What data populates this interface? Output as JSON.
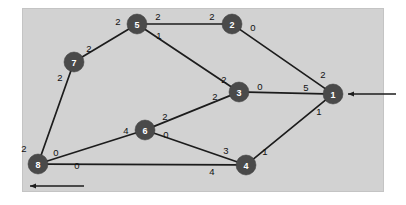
{
  "figure": {
    "background_color": "#ffffff",
    "panel_color": "#d2d2d2",
    "node_color": "#4a4a4a",
    "node_text_color": "#ffffff",
    "edge_color": "#1c1c1c"
  },
  "chart_data": {
    "type": "diagram",
    "diagram_kind": "flow-network",
    "title": "",
    "nodes": [
      {
        "id": "5",
        "label": "5",
        "x": 137,
        "y": 24,
        "r": 10
      },
      {
        "id": "2",
        "label": "2",
        "x": 232,
        "y": 24,
        "r": 10
      },
      {
        "id": "7",
        "label": "7",
        "x": 74,
        "y": 62,
        "r": 10
      },
      {
        "id": "3",
        "label": "3",
        "x": 239,
        "y": 92,
        "r": 10
      },
      {
        "id": "1",
        "label": "1",
        "x": 333,
        "y": 94,
        "r": 10
      },
      {
        "id": "6",
        "label": "6",
        "x": 145,
        "y": 130,
        "r": 10
      },
      {
        "id": "8",
        "label": "8",
        "x": 38,
        "y": 164,
        "r": 10
      },
      {
        "id": "4",
        "label": "4",
        "x": 246,
        "y": 165,
        "r": 10
      }
    ],
    "edges": [
      {
        "from": "7",
        "to": "5",
        "label_from": "2",
        "label_to": "2"
      },
      {
        "from": "5",
        "to": "2",
        "label_from": "2",
        "label_to": "2"
      },
      {
        "from": "2",
        "to": "1",
        "label_from": "0",
        "label_to": "2"
      },
      {
        "from": "5",
        "to": "3",
        "label_from": "1",
        "label_to": "2"
      },
      {
        "from": "3",
        "to": "1",
        "label_from": "0",
        "label_to": "5"
      },
      {
        "from": "6",
        "to": "3",
        "label_from": "2",
        "label_to": "2"
      },
      {
        "from": "6",
        "to": "4",
        "label_from": "0",
        "label_to": "3"
      },
      {
        "from": "8",
        "to": "6",
        "label_from": "0",
        "label_to": "4"
      },
      {
        "from": "8",
        "to": "4",
        "label_from": "0",
        "label_to": "4"
      },
      {
        "from": "7",
        "to": "8",
        "label_from": "2",
        "label_to": "2"
      },
      {
        "from": "4",
        "to": "1",
        "label_from": "1",
        "label_to": "1"
      }
    ],
    "edge_label_positions": [
      {
        "text": "2",
        "x": 118,
        "y": 21,
        "name": "label-7-5-at-5"
      },
      {
        "text": "2",
        "x": 89,
        "y": 48,
        "name": "label-7-5-at-7"
      },
      {
        "text": "2",
        "x": 158,
        "y": 16,
        "name": "label-5-2-at-5"
      },
      {
        "text": "2",
        "x": 212,
        "y": 16,
        "name": "label-5-2-at-2"
      },
      {
        "text": "1",
        "x": 159,
        "y": 35,
        "name": "label-5-3-at-5"
      },
      {
        "text": "2",
        "x": 224,
        "y": 79,
        "name": "label-5-3-at-3"
      },
      {
        "text": "0",
        "x": 253,
        "y": 27,
        "name": "label-2-1-at-2"
      },
      {
        "text": "2",
        "x": 323,
        "y": 74,
        "name": "label-2-1-at-1"
      },
      {
        "text": "0",
        "x": 260,
        "y": 86,
        "name": "label-3-1-at-3"
      },
      {
        "text": "5",
        "x": 306,
        "y": 87,
        "name": "label-3-1-at-1"
      },
      {
        "text": "2",
        "x": 165,
        "y": 116,
        "name": "label-6-3-at-6"
      },
      {
        "text": "2",
        "x": 215,
        "y": 96,
        "name": "label-6-3-at-3"
      },
      {
        "text": "4",
        "x": 126,
        "y": 130,
        "name": "label-8-6-at-6"
      },
      {
        "text": "0",
        "x": 56,
        "y": 152,
        "name": "label-8-6-at-8"
      },
      {
        "text": "0",
        "x": 166,
        "y": 134,
        "name": "label-6-4-at-6"
      },
      {
        "text": "3",
        "x": 226,
        "y": 150,
        "name": "label-6-4-at-4"
      },
      {
        "text": "0",
        "x": 77,
        "y": 165,
        "name": "label-8-4-at-8"
      },
      {
        "text": "4",
        "x": 212,
        "y": 171,
        "name": "label-8-4-at-4"
      },
      {
        "text": "2",
        "x": 24,
        "y": 148,
        "name": "label-7-8-at-8"
      },
      {
        "text": "2",
        "x": 60,
        "y": 77,
        "name": "label-7-8-at-7"
      },
      {
        "text": "1",
        "x": 265,
        "y": 151,
        "name": "label-4-1-at-4"
      },
      {
        "text": "1",
        "x": 319,
        "y": 111,
        "name": "label-4-1-at-1"
      }
    ],
    "terminals": [
      {
        "name": "source-arrow-into-node-1",
        "direction": "left",
        "from_x": 396,
        "from_y": 94,
        "to_x": 348,
        "to_y": 94
      },
      {
        "name": "sink-arrow-out-of-node-8",
        "direction": "left",
        "from_x": 84,
        "from_y": 186,
        "to_x": 30,
        "to_y": 186
      }
    ]
  }
}
